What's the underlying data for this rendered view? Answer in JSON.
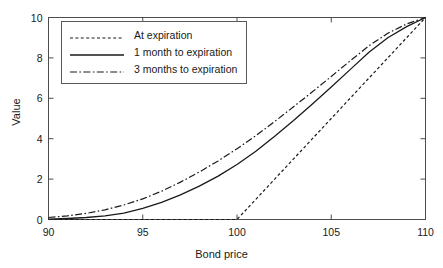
{
  "chart_data": {
    "type": "line",
    "title": "",
    "xlabel": "Bond price",
    "ylabel": "Value",
    "xlim": [
      90,
      110
    ],
    "ylim": [
      0,
      10
    ],
    "xticks": [
      90,
      95,
      100,
      105,
      110
    ],
    "yticks": [
      0,
      2,
      4,
      6,
      8,
      10
    ],
    "xtick_labels": [
      "90",
      "95",
      "100",
      "105",
      "110"
    ],
    "ytick_labels": [
      "0",
      "2",
      "4",
      "6",
      "8",
      "10"
    ],
    "grid": false,
    "legend_position": "upper left",
    "line_color": "#1a1a1a",
    "background_color": "#ffffff",
    "frame_color": "#4d4d4d",
    "x": [
      90,
      91,
      92,
      93,
      94,
      95,
      96,
      97,
      98,
      99,
      100,
      101,
      102,
      103,
      104,
      105,
      106,
      107,
      108,
      109,
      110
    ],
    "series": [
      {
        "name": "At expiration",
        "label": "At expiration",
        "style": "dotted",
        "dasharray": "3,2.4",
        "width": 1.2,
        "values": [
          0,
          0,
          0,
          0,
          0,
          0,
          0,
          0,
          0,
          0,
          0,
          1,
          2,
          3,
          4,
          5,
          6,
          7,
          8,
          9,
          10
        ]
      },
      {
        "name": "1 month to expiration",
        "label": "1 month to expiration",
        "style": "solid",
        "dasharray": "none",
        "width": 1.3,
        "values": [
          0.02,
          0.05,
          0.1,
          0.18,
          0.32,
          0.55,
          0.85,
          1.22,
          1.65,
          2.15,
          2.72,
          3.38,
          4.12,
          4.9,
          5.72,
          6.56,
          7.42,
          8.28,
          9.0,
          9.55,
          10.0
        ]
      },
      {
        "name": "3 months to expiration",
        "label": "3 months to expiration",
        "style": "dashdot",
        "dasharray": "7,2.4,1.6,2.4",
        "width": 1.2,
        "values": [
          0.1,
          0.18,
          0.3,
          0.48,
          0.72,
          1.02,
          1.4,
          1.85,
          2.35,
          2.9,
          3.5,
          4.15,
          4.85,
          5.58,
          6.32,
          7.08,
          7.85,
          8.6,
          9.22,
          9.68,
          10.0
        ]
      }
    ]
  }
}
